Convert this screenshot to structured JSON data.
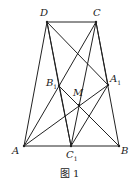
{
  "figure": {
    "caption": "图 1",
    "points": {
      "D": {
        "label": "D",
        "sub": "",
        "x": 47,
        "y": 22
      },
      "C": {
        "label": "C",
        "sub": "",
        "x": 96,
        "y": 22
      },
      "A": {
        "label": "A",
        "sub": "",
        "x": 24,
        "y": 146
      },
      "B": {
        "label": "B",
        "sub": "",
        "x": 119,
        "y": 146
      },
      "C1": {
        "label": "C",
        "sub": "1",
        "x": 71,
        "y": 146
      },
      "B1": {
        "label": "B",
        "sub": "1",
        "x": 59,
        "y": 86
      },
      "A1": {
        "label": "A",
        "sub": "1",
        "x": 108,
        "y": 85
      },
      "M": {
        "label": "M",
        "sub": "",
        "x": 79,
        "y": 105
      }
    },
    "segments": [
      [
        "A",
        "D"
      ],
      [
        "D",
        "C"
      ],
      [
        "C",
        "B"
      ],
      [
        "A",
        "B"
      ],
      [
        "D",
        "B1"
      ],
      [
        "B1",
        "B"
      ],
      [
        "D",
        "A1"
      ],
      [
        "C",
        "B1"
      ],
      [
        "B1",
        "A"
      ],
      [
        "C",
        "A1"
      ],
      [
        "C",
        "C1"
      ],
      [
        "D",
        "C1"
      ],
      [
        "A",
        "A1"
      ],
      [
        "B1",
        "C1"
      ],
      [
        "A1",
        "C1"
      ]
    ],
    "stroke_color": "#222222"
  }
}
